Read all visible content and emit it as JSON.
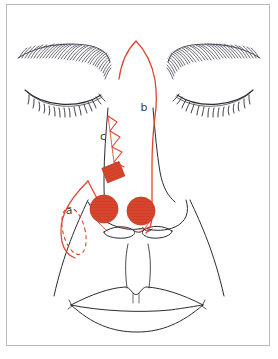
{
  "figure": {
    "view": "frontal face, eyes closed",
    "frame": {
      "border_color": "#b9b9b9",
      "background": "#ffffff"
    },
    "width": 278,
    "height": 359
  },
  "colors": {
    "marking_red": "#e0452c",
    "marking_red_fill": "#d8452c",
    "anatomy_line": "#2b2b33",
    "brow_hair": "#4a4a57",
    "label_text": "#3a3f45",
    "frame_border": "#b9b9b9",
    "background": "#ffffff"
  },
  "labels": [
    {
      "id": "a",
      "text": "a",
      "x": 69,
      "y": 214,
      "refers_to": "nasolabial flap with dashed ellipse donor outline"
    },
    {
      "id": "b",
      "text": "b",
      "x": 144,
      "y": 111,
      "refers_to": "dorsal nasal / paramedian flap outline"
    },
    {
      "id": "c",
      "text": "c",
      "x": 103,
      "y": 140,
      "refers_to": "zigzag ladder incision with rectangular graft"
    }
  ],
  "markings": {
    "red_defect_circles": [
      {
        "name": "left-nasal-sidewall-defect",
        "cx": 104,
        "cy": 209,
        "r": 14
      },
      {
        "name": "right-nasal-sidewall-defect",
        "cx": 141,
        "cy": 211,
        "r": 14
      }
    ],
    "red_graft_rectangle": {
      "name": "rectangular-graft-marker",
      "x": 104,
      "y": 165,
      "width": 18,
      "height": 15,
      "rotation_deg": -22
    },
    "zigzag_segments": 4,
    "dashed_ellipse": {
      "name": "donor-site-dashed-ellipse",
      "cx": 74,
      "cy": 230,
      "rx": 11,
      "ry": 24,
      "rotation_deg": -14
    }
  },
  "anatomy": {
    "parts": [
      "left-eyebrow",
      "right-eyebrow",
      "left-closed-eye",
      "right-closed-eye",
      "nose-dorsum",
      "nasal-alae",
      "nostrils",
      "philtrum",
      "upper-lip",
      "lower-lip",
      "left-nasolabial-fold",
      "right-nasolabial-fold"
    ],
    "brow_hair_strokes_per_brow": 34,
    "lash_strokes_per_eye": 17
  }
}
